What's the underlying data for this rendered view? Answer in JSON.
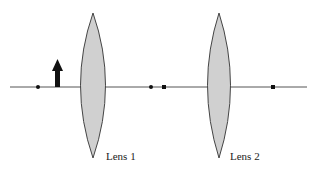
{
  "diagram": {
    "type": "optics-two-lens",
    "axis": {
      "y": 87,
      "x_start": 10,
      "x_end": 307,
      "color": "#555555"
    },
    "object": {
      "name": "object-arrow",
      "x": 57,
      "base_y": 87,
      "tip_y": 60,
      "color": "#111111"
    },
    "lenses": [
      {
        "label": "Lens 1",
        "cx": 93,
        "top": 13,
        "bottom": 158,
        "half_width": 12,
        "label_x": 106,
        "label_y": 160
      },
      {
        "label": "Lens 2",
        "cx": 219,
        "top": 13,
        "bottom": 158,
        "half_width": 11,
        "label_x": 230,
        "label_y": 160
      }
    ],
    "points": [
      {
        "name": "focal-point-lens1-left",
        "x": 38,
        "shape": "dot"
      },
      {
        "name": "focal-point-lens1-right",
        "x": 151,
        "shape": "dot"
      },
      {
        "name": "focal-point-lens2-left",
        "x": 164,
        "shape": "square"
      },
      {
        "name": "focal-point-lens2-right",
        "x": 273,
        "shape": "square"
      }
    ],
    "lens_fill": "#d0d0d0",
    "lens_stroke": "#444444"
  }
}
